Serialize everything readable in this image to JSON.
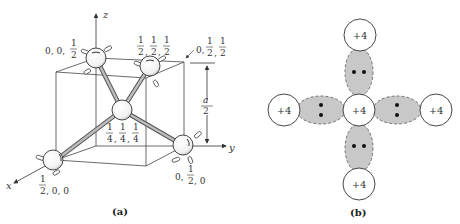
{
  "panel_a": {
    "caption": "(a)",
    "axes": {
      "x": "x",
      "y": "y",
      "z": "z"
    },
    "dimension_label": {
      "num": "a",
      "den": "2"
    },
    "atoms": [
      {
        "id": "atom-0-0-half",
        "coords": "0, 0, ½",
        "parts": [
          "0, 0,",
          "1",
          "2"
        ]
      },
      {
        "id": "atom-half-half-half",
        "coords": "½, ½, ½",
        "parts": [
          "1",
          "2"
        ]
      },
      {
        "id": "corner-0-half-half",
        "coords": "0, ½, ½",
        "parts": [
          "0,",
          "1",
          "2"
        ]
      },
      {
        "id": "atom-quarter",
        "coords": "¼, ¼, ¼",
        "parts": [
          "1",
          "4"
        ]
      },
      {
        "id": "atom-half-0-0",
        "coords": "½, 0, 0",
        "parts": [
          "1",
          "2",
          ", 0, 0"
        ]
      },
      {
        "id": "atom-0-half-0",
        "coords": "0, ½, 0",
        "parts": [
          "0,",
          "1",
          "2",
          ", 0"
        ]
      }
    ]
  },
  "panel_b": {
    "caption": "(b)",
    "ion_charge": "+4",
    "ions": [
      "top",
      "left",
      "center",
      "right",
      "bottom"
    ],
    "bond_fill": "#c8c8c8",
    "electrons_per_bond": 2
  }
}
